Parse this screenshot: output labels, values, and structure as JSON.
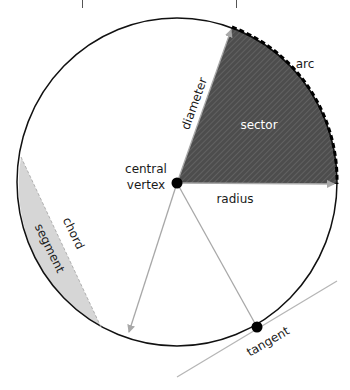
{
  "labels": {
    "arc": "arc",
    "sector": "sector",
    "diameter": "diameter",
    "radius": "radius",
    "central_vertex_line1": "central",
    "central_vertex_line2": "vertex",
    "chord": "chord",
    "segment": "segment",
    "tangent": "tangent"
  },
  "colors": {
    "circle_stroke": "#111111",
    "sector_fill": "#4d4d4d",
    "sector_hatch": "#6e6e6e",
    "segment_fill": "#d6d6d6",
    "arrow_line": "#a8a8a8",
    "tangent_line": "#b5b5b5",
    "point": "#000000"
  }
}
